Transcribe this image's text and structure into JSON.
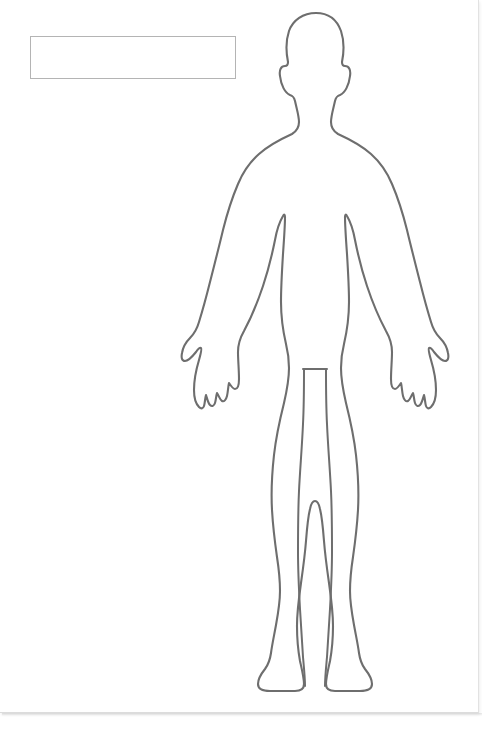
{
  "document": {
    "type": "body-diagram-form",
    "title": "",
    "background_color": "#ffffff",
    "page_width": 478,
    "page_height": 712
  },
  "note_box": {
    "name": "annotation-text-box",
    "border_color": "#b4b4b4",
    "fill_color": "#ffffff",
    "x": 30,
    "y": 36,
    "width": 206,
    "height": 43,
    "value": "",
    "placeholder": "",
    "faint_lines": [
      "                                        ",
      "                                        ",
      "                                        "
    ]
  },
  "figure": {
    "name": "human-body-outline",
    "view": "anterior",
    "stroke_color": "#6e6e6e",
    "stroke_width": 2.1,
    "fill": "none",
    "parts": [
      "head",
      "ears",
      "neck",
      "shoulders",
      "torso",
      "left-arm",
      "right-arm",
      "left-hand",
      "right-hand",
      "hips",
      "left-leg",
      "right-leg",
      "left-foot",
      "right-foot",
      "inner-leg-separation"
    ]
  }
}
